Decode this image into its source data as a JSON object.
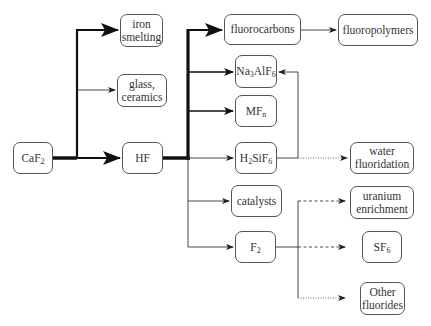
{
  "diagram": {
    "nodes": {
      "caf2": {
        "label": "CaF",
        "sub": "2"
      },
      "iron_smelting": {
        "line1": "iron",
        "line2": "smelting"
      },
      "glass_ceramics": {
        "line1": "glass,",
        "line2": "ceramics"
      },
      "hf": {
        "label": "HF"
      },
      "fluorocarbons": {
        "label": "fluorocarbons"
      },
      "fluoropolymers": {
        "label": "fluoropolymers"
      },
      "na3alf6": {
        "p1": "Na",
        "s1": "3",
        "p2": "AlF",
        "s2": "6"
      },
      "mfn": {
        "p1": "MF",
        "s1": "n"
      },
      "h2sif6": {
        "p1": "H",
        "s1": "2",
        "p2": "SiF",
        "s2": "6"
      },
      "catalysts": {
        "label": "catalysts"
      },
      "f2": {
        "p1": "F",
        "s1": "2"
      },
      "water_fluoridation": {
        "line1": "water",
        "line2": "fluoridation"
      },
      "uranium_enrichment": {
        "line1": "uranium",
        "line2": "enrichment"
      },
      "sf6": {
        "p1": "SF",
        "s1": "6"
      },
      "other_fluorides": {
        "line1": "Other",
        "line2": "fluorides"
      }
    },
    "edges": [
      {
        "from": "CaF2",
        "to": "iron smelting",
        "style": "thick"
      },
      {
        "from": "CaF2",
        "to": "glass, ceramics",
        "style": "thin"
      },
      {
        "from": "CaF2",
        "to": "HF",
        "style": "thick"
      },
      {
        "from": "HF",
        "to": "fluorocarbons",
        "style": "thick"
      },
      {
        "from": "HF",
        "to": "Na3AlF6",
        "style": "medium"
      },
      {
        "from": "HF",
        "to": "MFn",
        "style": "medium"
      },
      {
        "from": "HF",
        "to": "H2SiF6",
        "style": "thin"
      },
      {
        "from": "HF",
        "to": "catalysts",
        "style": "thin"
      },
      {
        "from": "HF",
        "to": "F2",
        "style": "thin"
      },
      {
        "from": "fluorocarbons",
        "to": "fluoropolymers",
        "style": "thin"
      },
      {
        "from": "H2SiF6",
        "to": "Na3AlF6",
        "style": "thin"
      },
      {
        "from": "H2SiF6",
        "to": "water fluoridation",
        "style": "dotted"
      },
      {
        "from": "F2",
        "to": "uranium enrichment",
        "style": "dashed"
      },
      {
        "from": "F2",
        "to": "SF6",
        "style": "dashed"
      },
      {
        "from": "F2",
        "to": "Other fluorides",
        "style": "dotted"
      }
    ],
    "colors": {
      "line": "#111111",
      "border": "#555555",
      "text": "#333333"
    }
  }
}
